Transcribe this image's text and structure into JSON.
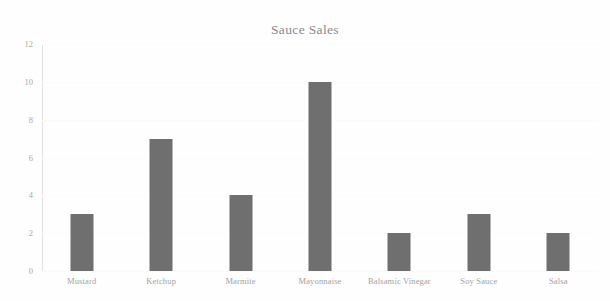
{
  "chart_data": {
    "type": "bar",
    "title": "Sauce Sales",
    "xlabel": "",
    "ylabel": "",
    "categories": [
      "Mustard",
      "Ketchup",
      "Marmite",
      "Mayonnaise",
      "Balsamic Vinegar",
      "Soy Sauce",
      "Salsa"
    ],
    "values": [
      3,
      7,
      4,
      10,
      2,
      3,
      2
    ],
    "ylim": [
      0,
      12
    ],
    "yticks": [
      0,
      2,
      4,
      6,
      8,
      10,
      12
    ],
    "ytick_labels": [
      "0",
      "2",
      "4",
      "6",
      "8",
      "10",
      "12"
    ],
    "grid": false,
    "legend": null,
    "bar_color": "#6f6f6f",
    "background_color": "#fefefe",
    "title_color": "#8a8a8a",
    "tick_label_color": "#a5a5a5",
    "axis_line_color": "#e2e2e2"
  }
}
